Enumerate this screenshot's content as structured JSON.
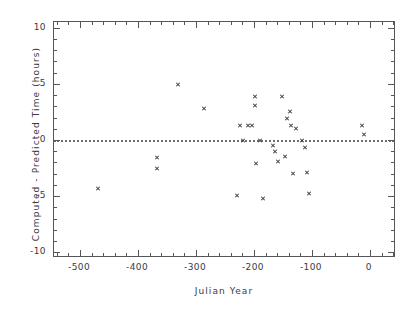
{
  "chart_data": {
    "type": "scatter",
    "title": "",
    "xlabel": "Julian Year",
    "ylabel": "Computed  -  Predicted Time (hours)",
    "xlim": [
      -545,
      45
    ],
    "ylim": [
      -10.5,
      10.5
    ],
    "xticks": [
      -500,
      -400,
      -300,
      -200,
      -100,
      0
    ],
    "xticklabels": [
      "-500",
      "-400",
      "-300",
      "-200",
      "-100",
      "0"
    ],
    "yticks": [
      10,
      5,
      0,
      -5,
      -10
    ],
    "yticklabels": [
      "10",
      "5",
      "0",
      "-5",
      "-10"
    ],
    "xminor_step": 20,
    "yminor_step": 1,
    "grid": false,
    "legend": false,
    "marker": "x",
    "marker_color": "#3a3a3f",
    "frame_color": "#55555a",
    "reference_line": {
      "y": 0,
      "style": "dotted",
      "color": "#6d6d72"
    },
    "points": [
      {
        "x": -469,
        "y": -4.3
      },
      {
        "x": -367,
        "y": -1.6
      },
      {
        "x": -367,
        "y": -2.5
      },
      {
        "x": -331,
        "y": 4.9
      },
      {
        "x": -286,
        "y": 2.8
      },
      {
        "x": -229,
        "y": -4.9
      },
      {
        "x": -224,
        "y": 1.3
      },
      {
        "x": -219,
        "y": 0.0
      },
      {
        "x": -210,
        "y": 1.3
      },
      {
        "x": -203,
        "y": 1.3
      },
      {
        "x": -198,
        "y": 3.9
      },
      {
        "x": -198,
        "y": 3.1
      },
      {
        "x": -196,
        "y": -2.1
      },
      {
        "x": -190,
        "y": 0.0
      },
      {
        "x": -184,
        "y": -5.2
      },
      {
        "x": -167,
        "y": -0.5
      },
      {
        "x": -164,
        "y": -1.0
      },
      {
        "x": -159,
        "y": -1.9
      },
      {
        "x": -152,
        "y": 3.9
      },
      {
        "x": -146,
        "y": -1.5
      },
      {
        "x": -143,
        "y": 1.9
      },
      {
        "x": -138,
        "y": 2.5
      },
      {
        "x": -136,
        "y": 1.3
      },
      {
        "x": -133,
        "y": -3.0
      },
      {
        "x": -128,
        "y": 1.0
      },
      {
        "x": -117,
        "y": 0.0
      },
      {
        "x": -112,
        "y": -0.7
      },
      {
        "x": -109,
        "y": -2.9
      },
      {
        "x": -105,
        "y": -4.8
      },
      {
        "x": -14,
        "y": 1.3
      },
      {
        "x": -11,
        "y": 0.5
      }
    ]
  }
}
